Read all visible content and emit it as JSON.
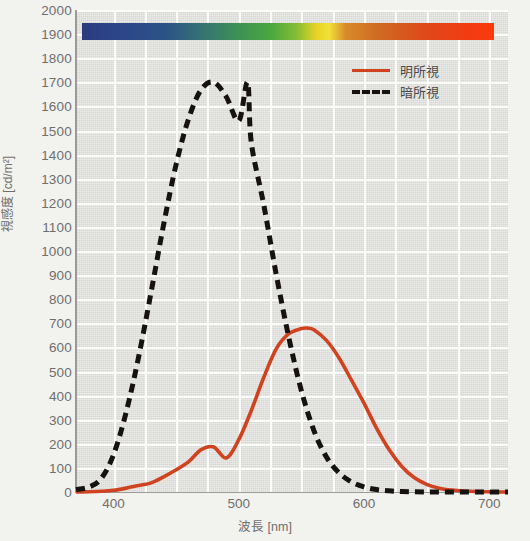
{
  "chart_data": {
    "type": "line",
    "title": "",
    "xlabel": "波長 [nm]",
    "ylabel": "視感度 [cd/m²]",
    "xlim": [
      370,
      715
    ],
    "ylim": [
      0,
      2000
    ],
    "xticks": [
      400,
      500,
      600,
      700
    ],
    "yticks": [
      0,
      100,
      200,
      300,
      400,
      500,
      600,
      700,
      800,
      900,
      1000,
      1100,
      1200,
      1300,
      1400,
      1500,
      1600,
      1700,
      1800,
      1900,
      2000
    ],
    "grid": true,
    "legend_position": "top-right",
    "series": [
      {
        "name": "明所視",
        "style": "solid",
        "color": "#cf4320",
        "peak_x": 555,
        "peak_y": 680,
        "x": [
          370,
          380,
          390,
          400,
          410,
          420,
          430,
          440,
          450,
          460,
          470,
          480,
          490,
          500,
          510,
          520,
          530,
          540,
          550,
          555,
          560,
          570,
          580,
          590,
          600,
          610,
          620,
          630,
          640,
          650,
          660,
          670,
          680,
          690,
          700,
          710,
          715
        ],
        "y": [
          0,
          1,
          3,
          7,
          16,
          27,
          38,
          63,
          92,
          126,
          176,
          187,
          141,
          217,
          338,
          476,
          595,
          657,
          678,
          680,
          673,
          629,
          557,
          464,
          369,
          265,
          176,
          107,
          60,
          32,
          16,
          8,
          4,
          2,
          1,
          0,
          0
        ]
      },
      {
        "name": "暗所視",
        "style": "dashed",
        "color": "#15120f",
        "peak_x": 507,
        "peak_y": 1700,
        "x": [
          370,
          380,
          390,
          400,
          410,
          420,
          430,
          440,
          450,
          460,
          470,
          480,
          490,
          500,
          507,
          510,
          520,
          530,
          540,
          550,
          560,
          570,
          580,
          590,
          600,
          610,
          620,
          630,
          640,
          650,
          660,
          670,
          680,
          690,
          700,
          710,
          715
        ],
        "y": [
          10,
          20,
          55,
          155,
          330,
          560,
          830,
          1110,
          1360,
          1550,
          1670,
          1700,
          1640,
          1540,
          1700,
          1450,
          1190,
          900,
          640,
          420,
          255,
          145,
          80,
          42,
          21,
          10,
          5,
          2,
          1,
          0,
          0,
          0,
          0,
          0,
          0,
          0,
          0
        ]
      }
    ],
    "spectrum_bar": {
      "present": true,
      "stops": [
        {
          "pos": 0,
          "color": "#2b3c7e"
        },
        {
          "pos": 8,
          "color": "#2c4489"
        },
        {
          "pos": 20,
          "color": "#2b5286"
        },
        {
          "pos": 30,
          "color": "#36766f"
        },
        {
          "pos": 38,
          "color": "#3e9154"
        },
        {
          "pos": 46,
          "color": "#4aa83f"
        },
        {
          "pos": 52,
          "color": "#84bd34"
        },
        {
          "pos": 57,
          "color": "#e8d425"
        },
        {
          "pos": 60,
          "color": "#f2e03a"
        },
        {
          "pos": 64,
          "color": "#d98b2a"
        },
        {
          "pos": 72,
          "color": "#cf6a22"
        },
        {
          "pos": 84,
          "color": "#e0471a"
        },
        {
          "pos": 94,
          "color": "#f23b12"
        },
        {
          "pos": 100,
          "color": "#fa3a0c"
        }
      ]
    }
  },
  "legend": {
    "items": [
      {
        "label": "明所視",
        "style": "solid",
        "color": "#cf4320"
      },
      {
        "label": "暗所視",
        "style": "dashed",
        "color": "#15120f"
      }
    ]
  },
  "axes": {
    "y_label": "視感度 [cd/m²]",
    "x_label": "波長 [nm]",
    "y_ticks": [
      "2000",
      "1900",
      "1800",
      "1700",
      "1600",
      "1500",
      "1400",
      "1300",
      "1200",
      "1100",
      "1000",
      "900",
      "800",
      "700",
      "600",
      "500",
      "400",
      "300",
      "200",
      "100",
      "0"
    ],
    "x_ticks": [
      "400",
      "500",
      "600",
      "700"
    ]
  },
  "colors": {
    "photopic": "#cf4320",
    "scotopic": "#15120f",
    "plot_background": "#e4e4e1",
    "page_background": "#f2f2ef",
    "gridline": "#fbfbfa",
    "axis": "#9a9a96",
    "tick_text": "#6f6f6c"
  }
}
